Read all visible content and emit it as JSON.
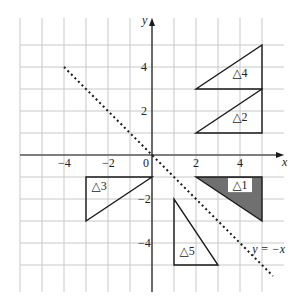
{
  "diagram": {
    "type": "coordinate-grid-transformations",
    "axes": {
      "x_label": "x",
      "y_label": "y",
      "origin_label": "0",
      "x_ticks": [
        {
          "value": -4,
          "label": "−4"
        },
        {
          "value": -2,
          "label": "−2"
        },
        {
          "value": 2,
          "label": "2"
        },
        {
          "value": 4,
          "label": "4"
        }
      ],
      "y_ticks": [
        {
          "value": 4,
          "label": "4"
        },
        {
          "value": 2,
          "label": "2"
        },
        {
          "value": -2,
          "label": "−2"
        },
        {
          "value": -4,
          "label": "−4"
        }
      ],
      "x_range": [
        -6,
        6
      ],
      "y_range": [
        -6,
        6
      ],
      "grid": true
    },
    "mirror_line": {
      "label": "y = −x",
      "style": "dotted",
      "from": [
        -4,
        4
      ],
      "to": [
        5.5,
        -5.5
      ]
    },
    "triangles": [
      {
        "id": "t1",
        "label": "△1",
        "vertices": [
          [
            2,
            -1
          ],
          [
            5,
            -1
          ],
          [
            5,
            -3
          ]
        ],
        "shaded": true,
        "fill": "#707070"
      },
      {
        "id": "t2",
        "label": "△2",
        "vertices": [
          [
            2,
            1
          ],
          [
            5,
            1
          ],
          [
            5,
            3
          ]
        ],
        "shaded": false
      },
      {
        "id": "t3",
        "label": "△3",
        "vertices": [
          [
            -3,
            -1
          ],
          [
            0,
            -1
          ],
          [
            -3,
            -3
          ]
        ],
        "shaded": false
      },
      {
        "id": "t4",
        "label": "△4",
        "vertices": [
          [
            2,
            3
          ],
          [
            5,
            3
          ],
          [
            5,
            5
          ]
        ],
        "shaded": false
      },
      {
        "id": "t5",
        "label": "△5",
        "vertices": [
          [
            1,
            -2
          ],
          [
            1,
            -5
          ],
          [
            3,
            -5
          ]
        ],
        "shaded": false
      }
    ],
    "colors": {
      "grid": "#c8c8c8",
      "axis": "#1a1a1a",
      "outline": "#1a1a1a",
      "shade": "#707070"
    }
  }
}
